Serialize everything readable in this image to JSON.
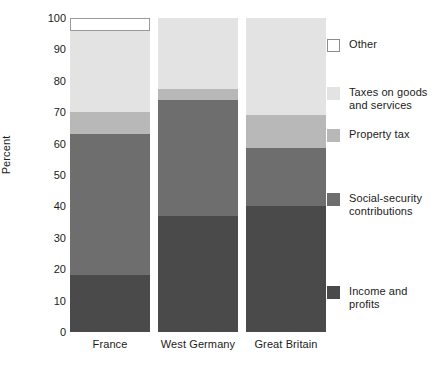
{
  "chart_data": {
    "type": "bar",
    "subtype": "stacked-bar-100",
    "title": "",
    "xlabel": "",
    "ylabel": "Percent",
    "ylim": [
      0,
      100
    ],
    "ytick_step": 10,
    "yticks": [
      0,
      10,
      20,
      30,
      40,
      50,
      60,
      70,
      80,
      90,
      100
    ],
    "ytick_labels": [
      "0",
      "10",
      "20",
      "30",
      "40",
      "50",
      "60",
      "70",
      "80",
      "90",
      "100"
    ],
    "grid": false,
    "legend_position": "right",
    "categories": [
      "France",
      "West Germany",
      "Great Britain"
    ],
    "series": [
      {
        "name": "Income and profits",
        "color": "#4a4a4a",
        "values": [
          18,
          37,
          40
        ]
      },
      {
        "name": "Social-security contributions",
        "color": "#6e6e6e",
        "values": [
          45,
          37,
          18.5
        ]
      },
      {
        "name": "Property tax",
        "color": "#b8b8b8",
        "values": [
          7,
          3.5,
          10.5
        ]
      },
      {
        "name": "Taxes on goods and services",
        "color": "#e3e3e3",
        "values": [
          26,
          22.5,
          31
        ]
      },
      {
        "name": "Other",
        "color": "#ffffff",
        "values": [
          4,
          0,
          0
        ]
      }
    ],
    "cumulative_tops": {
      "France": [
        18,
        63,
        70,
        96,
        100
      ],
      "West Germany": [
        37,
        74,
        77.5,
        100,
        100
      ],
      "Great Britain": [
        40,
        58.5,
        69,
        100,
        100
      ]
    }
  },
  "axis": {
    "y_title": "Percent"
  },
  "legend": {
    "entries": [
      {
        "label": "Other",
        "color": "#ffffff",
        "outlined": true
      },
      {
        "label": "Taxes on goods and services",
        "color": "#e3e3e3",
        "outlined": false
      },
      {
        "label": "Property tax",
        "color": "#b8b8b8",
        "outlined": false
      },
      {
        "label": "Social-security contributions",
        "color": "#6e6e6e",
        "outlined": false
      },
      {
        "label": "Income and profits",
        "color": "#4a4a4a",
        "outlined": false
      }
    ]
  },
  "colors": {
    "background": "#ffffff",
    "text": "#1b1b1b",
    "other": "#ffffff",
    "taxes_goods_services": "#e3e3e3",
    "property_tax": "#b8b8b8",
    "social_security": "#6e6e6e",
    "income_profits": "#4a4a4a"
  }
}
